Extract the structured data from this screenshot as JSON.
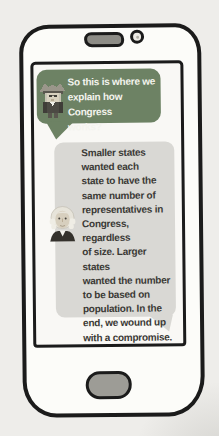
{
  "illustration_type": "hand-drawn smartphone chat comic",
  "chat": {
    "messages": [
      {
        "avatar_icon": "franklin-character-avatar",
        "bubble_color_key": "bubble_green",
        "text": "So this is where we\nexplain how Congress\nworks?"
      },
      {
        "avatar_icon": "washington-character-avatar",
        "bubble_color_key": "bubble_gray",
        "text": "Smaller states\nwanted each\nstate to have the\nsame number of\nrepresentatives in\nCongress, regardless\nof size. Larger states\nwanted the number\nto be based on\npopulation. In the\nend, we wound up\nwith a compromise."
      }
    ]
  },
  "colors": {
    "page_bg": "#eeedea",
    "outline": "#1b1b1b",
    "phone_fill": "#fcfcf9",
    "screen_fill": "#f9f8f5",
    "bubble_green": "#6d8264",
    "bubble_gray": "#d9d8d4",
    "text_light": "#f4f4ee",
    "text_dark": "#3b3a36",
    "speaker_fill": "#8d8c86",
    "home_fill": "#9d9c96"
  }
}
